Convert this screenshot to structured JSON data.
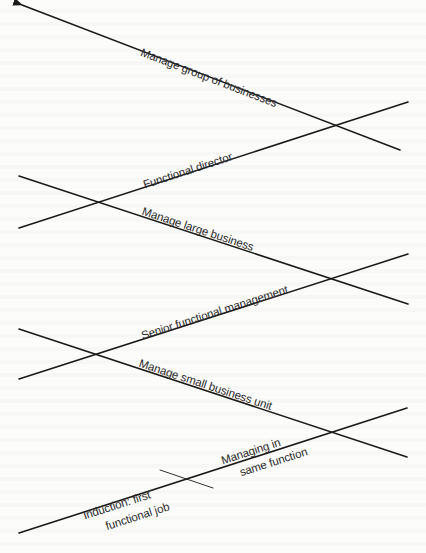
{
  "diagram": {
    "type": "career-path-zigzag",
    "colors": {
      "line": "#1a1a1a",
      "text": "#2a2a2a",
      "background": "#fcfcfb"
    },
    "stages": [
      {
        "id": "induction",
        "label_line1": "Induction: first",
        "label_line2": "functional job"
      },
      {
        "id": "managing-same-function",
        "label_line1": "Managing in",
        "label_line2": "same function"
      },
      {
        "id": "manage-small-business-unit",
        "label": "Manage small business unit"
      },
      {
        "id": "senior-functional-management",
        "label": "Senior functional management"
      },
      {
        "id": "manage-large-business",
        "label": "Manage large business"
      },
      {
        "id": "functional-director",
        "label": "Functional director"
      },
      {
        "id": "manage-group-of-businesses",
        "label": "Manage group of businesses"
      }
    ],
    "arrow": {
      "direction": "up-left"
    }
  }
}
